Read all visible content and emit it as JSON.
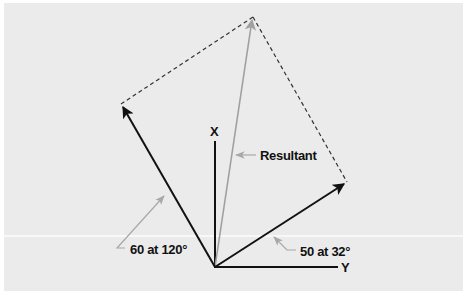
{
  "diagram": {
    "type": "vector-addition-parallelogram",
    "axes": {
      "x_label": "X",
      "y_label": "Y"
    },
    "vectors": [
      {
        "name": "vector-a",
        "label": "60 at 120°",
        "magnitude": 60,
        "angle_deg": 120,
        "color": "#111111"
      },
      {
        "name": "vector-b",
        "label": "50 at 32°",
        "magnitude": 50,
        "angle_deg": 32,
        "color": "#111111"
      },
      {
        "name": "resultant",
        "label": "Resultant",
        "color": "#a0a0a0"
      }
    ],
    "colors": {
      "background": "#ebebeb",
      "vector": "#111111",
      "resultant": "#a0a0a0",
      "dashed": "#333333",
      "leader": "#a8a8a8"
    }
  }
}
